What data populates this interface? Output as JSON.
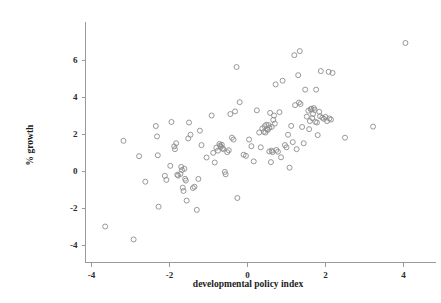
{
  "chart_data": {
    "type": "scatter",
    "title": "",
    "xlabel": "developmental policy index",
    "ylabel": "% growth",
    "xlim": [
      -4.55,
      4.55
    ],
    "ylim": [
      -4.35,
      7.3
    ],
    "xticks": [
      -4,
      -2,
      0,
      2,
      4
    ],
    "xtick_labels": [
      "-4",
      "-2",
      "0",
      "2",
      "4"
    ],
    "yticks": [
      -4,
      -2,
      0,
      2,
      4,
      6
    ],
    "ytick_labels": [
      "-4",
      "-2",
      "0",
      "2",
      "4",
      "6"
    ],
    "grid": false,
    "legend": null,
    "marker": "open-circle",
    "marker_color": "#8c8c8c",
    "n_points": 135,
    "points": [
      [
        -3.65,
        -3.0
      ],
      [
        -3.18,
        1.63
      ],
      [
        -2.92,
        -3.7
      ],
      [
        -2.78,
        0.8
      ],
      [
        -2.62,
        -0.58
      ],
      [
        -2.35,
        2.43
      ],
      [
        -2.32,
        1.87
      ],
      [
        -2.3,
        0.85
      ],
      [
        -2.28,
        -1.93
      ],
      [
        -2.12,
        -0.26
      ],
      [
        -2.08,
        -0.48
      ],
      [
        -1.98,
        0.28
      ],
      [
        -1.95,
        2.65
      ],
      [
        -1.88,
        1.33
      ],
      [
        -1.86,
        1.18
      ],
      [
        -1.83,
        1.5
      ],
      [
        -1.8,
        -0.2
      ],
      [
        -1.78,
        -0.25
      ],
      [
        -1.72,
        -0.16
      ],
      [
        -1.7,
        0.22
      ],
      [
        -1.68,
        0.05
      ],
      [
        -1.66,
        -0.9
      ],
      [
        -1.64,
        -1.08
      ],
      [
        -1.6,
        -0.42
      ],
      [
        -1.58,
        -0.52
      ],
      [
        -1.56,
        -1.6
      ],
      [
        -1.52,
        1.76
      ],
      [
        -1.5,
        2.62
      ],
      [
        -1.46,
        1.96
      ],
      [
        -1.4,
        -0.92
      ],
      [
        -1.36,
        -0.85
      ],
      [
        -1.3,
        -2.1
      ],
      [
        -1.26,
        -0.43
      ],
      [
        -1.22,
        2.18
      ],
      [
        -1.18,
        1.4
      ],
      [
        -1.05,
        0.73
      ],
      [
        -0.92,
        3.0
      ],
      [
        -0.88,
        0.98
      ],
      [
        -0.84,
        0.46
      ],
      [
        -0.8,
        1.26
      ],
      [
        -0.76,
        1.1
      ],
      [
        -0.72,
        1.46
      ],
      [
        -0.7,
        1.37
      ],
      [
        -0.68,
        1.3
      ],
      [
        -0.64,
        1.22
      ],
      [
        -0.62,
        1.18
      ],
      [
        -0.58,
        -0.05
      ],
      [
        -0.56,
        -0.18
      ],
      [
        -0.52,
        1.02
      ],
      [
        -0.48,
        1.12
      ],
      [
        -0.44,
        3.08
      ],
      [
        -0.4,
        1.8
      ],
      [
        -0.36,
        1.7
      ],
      [
        -0.32,
        3.22
      ],
      [
        -0.28,
        5.62
      ],
      [
        -0.26,
        -1.46
      ],
      [
        -0.2,
        3.72
      ],
      [
        -0.1,
        0.88
      ],
      [
        -0.04,
        0.82
      ],
      [
        0.04,
        1.7
      ],
      [
        0.1,
        1.34
      ],
      [
        0.16,
        0.52
      ],
      [
        0.24,
        3.28
      ],
      [
        0.3,
        2.08
      ],
      [
        0.34,
        1.28
      ],
      [
        0.38,
        2.3
      ],
      [
        0.42,
        2.12
      ],
      [
        0.44,
        2.42
      ],
      [
        0.46,
        2.08
      ],
      [
        0.48,
        2.5
      ],
      [
        0.5,
        2.26
      ],
      [
        0.52,
        2.22
      ],
      [
        0.54,
        2.48
      ],
      [
        0.56,
        1.06
      ],
      [
        0.58,
        3.14
      ],
      [
        0.6,
        0.48
      ],
      [
        0.62,
        1.1
      ],
      [
        0.64,
        1.02
      ],
      [
        0.66,
        2.76
      ],
      [
        0.68,
        3.0
      ],
      [
        0.7,
        2.56
      ],
      [
        0.72,
        4.68
      ],
      [
        0.74,
        1.14
      ],
      [
        0.78,
        1.04
      ],
      [
        0.82,
        3.18
      ],
      [
        0.86,
        0.74
      ],
      [
        0.9,
        4.88
      ],
      [
        0.96,
        1.4
      ],
      [
        1.0,
        1.28
      ],
      [
        1.04,
        1.96
      ],
      [
        1.08,
        0.18
      ],
      [
        1.12,
        2.44
      ],
      [
        1.16,
        1.56
      ],
      [
        1.2,
        6.26
      ],
      [
        1.22,
        3.56
      ],
      [
        1.26,
        1.18
      ],
      [
        1.3,
        5.18
      ],
      [
        1.32,
        3.7
      ],
      [
        1.34,
        6.48
      ],
      [
        1.36,
        3.62
      ],
      [
        1.4,
        2.38
      ],
      [
        1.44,
        1.5
      ],
      [
        1.48,
        4.4
      ],
      [
        1.52,
        2.94
      ],
      [
        1.56,
        3.26
      ],
      [
        1.6,
        2.7
      ],
      [
        1.62,
        3.34
      ],
      [
        1.64,
        3.36
      ],
      [
        1.66,
        2.86
      ],
      [
        1.68,
        3.08
      ],
      [
        1.7,
        3.4
      ],
      [
        1.72,
        3.3
      ],
      [
        1.74,
        2.66
      ],
      [
        1.76,
        4.4
      ],
      [
        1.78,
        2.62
      ],
      [
        1.8,
        1.94
      ],
      [
        1.84,
        3.2
      ],
      [
        1.88,
        5.4
      ],
      [
        1.92,
        2.88
      ],
      [
        1.96,
        2.82
      ],
      [
        2.0,
        2.92
      ],
      [
        2.04,
        2.7
      ],
      [
        2.08,
        5.36
      ],
      [
        2.1,
        2.84
      ],
      [
        2.14,
        2.78
      ],
      [
        2.18,
        5.3
      ],
      [
        2.5,
        1.8
      ],
      [
        3.22,
        2.4
      ],
      [
        4.05,
        6.92
      ],
      [
        0.62,
        2.38
      ],
      [
        1.58,
        2.26
      ],
      [
        -1.62,
        0.12
      ],
      [
        -0.66,
        1.42
      ],
      [
        0.56,
        2.34
      ],
      [
        1.86,
        2.96
      ]
    ]
  },
  "axis_styling": {
    "axis_color": "#9a9a9a",
    "marker_stroke": "#8c8c8c",
    "text_color": "#1d1d1d",
    "background": "#ffffff"
  }
}
